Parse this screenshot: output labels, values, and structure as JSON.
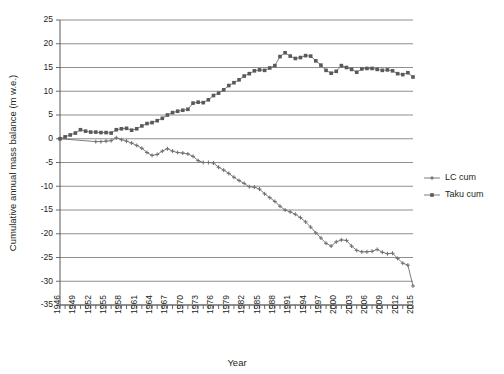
{
  "chart_data": {
    "type": "line",
    "title": "",
    "xlabel": "Year",
    "ylabel": "Cumulative annual mass balance (m w.e.)",
    "xlim": [
      1946,
      2015
    ],
    "ylim": [
      -35,
      25
    ],
    "ytick_step": 5,
    "xtick_label_step": 3,
    "grid": "horizontal",
    "legend_position": "right",
    "yticks": [
      25,
      20,
      15,
      10,
      5,
      0,
      -5,
      -10,
      -15,
      -20,
      -25,
      -30,
      -35
    ],
    "ytick_labels": [
      "25",
      "20",
      "15",
      "10",
      "5",
      "0",
      "-5",
      "-10",
      "-15",
      "-20",
      "-25",
      "-30",
      "-35"
    ],
    "xticks": [
      1946,
      1947,
      1948,
      1949,
      1950,
      1951,
      1952,
      1953,
      1954,
      1955,
      1956,
      1957,
      1958,
      1959,
      1960,
      1961,
      1962,
      1963,
      1964,
      1965,
      1966,
      1967,
      1968,
      1969,
      1970,
      1971,
      1972,
      1973,
      1974,
      1975,
      1976,
      1977,
      1978,
      1979,
      1980,
      1981,
      1982,
      1983,
      1984,
      1985,
      1986,
      1987,
      1988,
      1989,
      1990,
      1991,
      1992,
      1993,
      1994,
      1995,
      1996,
      1997,
      1998,
      1999,
      2000,
      2001,
      2002,
      2003,
      2004,
      2005,
      2006,
      2007,
      2008,
      2009,
      2010,
      2011,
      2012,
      2013,
      2014,
      2015
    ],
    "xtick_labels": [
      "1946",
      "1949",
      "1952",
      "1955",
      "1958",
      "1961",
      "1964",
      "1967",
      "1970",
      "1973",
      "1976",
      "1979",
      "1982",
      "1985",
      "1988",
      "1991",
      "1994",
      "1997",
      "2000",
      "2003",
      "2006",
      "2009",
      "2012",
      "2015"
    ],
    "series": [
      {
        "name": "LC cum",
        "marker": "cross",
        "color": "#6d6e71",
        "x": [
          1946,
          1953,
          1954,
          1955,
          1956,
          1957,
          1958,
          1959,
          1960,
          1961,
          1962,
          1963,
          1964,
          1965,
          1966,
          1967,
          1968,
          1969,
          1970,
          1971,
          1972,
          1973,
          1974,
          1975,
          1976,
          1977,
          1978,
          1979,
          1980,
          1981,
          1982,
          1983,
          1984,
          1985,
          1986,
          1987,
          1988,
          1989,
          1990,
          1991,
          1992,
          1993,
          1994,
          1995,
          1996,
          1997,
          1998,
          1999,
          2000,
          2001,
          2002,
          2003,
          2004,
          2005,
          2006,
          2007,
          2008,
          2009,
          2010,
          2011,
          2012,
          2013,
          2014,
          2015
        ],
        "values": [
          0,
          -0.6,
          -0.6,
          -0.5,
          -0.4,
          0.2,
          -0.2,
          -0.5,
          -0.9,
          -1.4,
          -2.0,
          -2.9,
          -3.5,
          -3.3,
          -2.6,
          -2.1,
          -2.6,
          -2.9,
          -3.0,
          -3.2,
          -3.7,
          -4.6,
          -5.0,
          -5.0,
          -5.1,
          -6.0,
          -6.6,
          -7.3,
          -8.1,
          -8.8,
          -9.4,
          -10.1,
          -10.2,
          -10.6,
          -11.6,
          -12.4,
          -13.2,
          -14.2,
          -15.0,
          -15.4,
          -15.9,
          -16.6,
          -17.5,
          -18.6,
          -19.8,
          -20.9,
          -22.0,
          -22.6,
          -21.7,
          -21.3,
          -21.4,
          -22.6,
          -23.5,
          -23.8,
          -23.8,
          -23.7,
          -23.3,
          -23.9,
          -24.2,
          -24.1,
          -25.2,
          -26.2,
          -26.6,
          -31.0
        ]
      },
      {
        "name": "Taku cum",
        "marker": "square",
        "color": "#58595b",
        "x": [
          1946,
          1947,
          1948,
          1949,
          1950,
          1951,
          1952,
          1953,
          1954,
          1955,
          1956,
          1957,
          1958,
          1959,
          1960,
          1961,
          1962,
          1963,
          1964,
          1965,
          1966,
          1967,
          1968,
          1969,
          1970,
          1971,
          1972,
          1973,
          1974,
          1975,
          1976,
          1977,
          1978,
          1979,
          1980,
          1981,
          1982,
          1983,
          1984,
          1985,
          1986,
          1987,
          1988,
          1989,
          1990,
          1991,
          1992,
          1993,
          1994,
          1995,
          1996,
          1997,
          1998,
          1999,
          2000,
          2001,
          2002,
          2003,
          2004,
          2005,
          2006,
          2007,
          2008,
          2009,
          2010,
          2011,
          2012,
          2013,
          2014,
          2015
        ],
        "values": [
          0,
          0.4,
          0.8,
          1.2,
          1.9,
          1.6,
          1.4,
          1.4,
          1.3,
          1.3,
          1.2,
          1.9,
          2.1,
          2.2,
          1.8,
          2.1,
          2.7,
          3.2,
          3.4,
          3.8,
          4.3,
          5.0,
          5.5,
          5.8,
          6.0,
          6.2,
          7.5,
          7.7,
          7.6,
          8.2,
          9.1,
          9.6,
          10.3,
          11.2,
          11.8,
          12.4,
          13.2,
          13.7,
          14.3,
          14.5,
          14.4,
          14.9,
          15.4,
          17.3,
          18.1,
          17.4,
          16.9,
          17.1,
          17.5,
          17.4,
          16.4,
          15.5,
          14.4,
          13.8,
          14.2,
          15.4,
          15.0,
          14.6,
          14.0,
          14.7,
          14.8,
          14.8,
          14.6,
          14.4,
          14.5,
          14.3,
          13.7,
          13.5,
          13.9,
          13.0
        ]
      }
    ]
  }
}
